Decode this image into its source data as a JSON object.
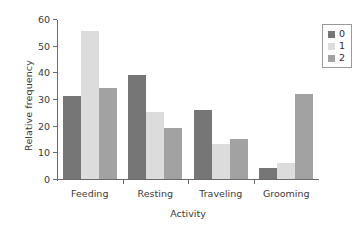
{
  "chart_data": {
    "type": "bar",
    "title": "",
    "xlabel": "Activity",
    "ylabel": "Relative frequency",
    "categories": [
      "Feeding",
      "Resting",
      "Traveling",
      "Grooming"
    ],
    "series": [
      {
        "name": "0",
        "color": "#767676",
        "values": [
          31,
          39,
          26,
          4
        ]
      },
      {
        "name": "1",
        "color": "#dcdcdc",
        "values": [
          55.5,
          25,
          13,
          6
        ]
      },
      {
        "name": "2",
        "color": "#a2a2a2",
        "values": [
          34,
          19,
          15,
          32
        ]
      }
    ],
    "ylim": [
      0,
      60
    ],
    "yticks": [
      0,
      10,
      20,
      30,
      40,
      50,
      60
    ],
    "ytick_labels": [
      "0",
      "10",
      "20",
      "30",
      "40",
      "50",
      "60"
    ],
    "grid": false,
    "legend_position": "top-right",
    "legend_entries": [
      "0",
      "1",
      "2"
    ]
  },
  "axes": {
    "y_title": "Relative frequency",
    "x_title": "Activity"
  }
}
